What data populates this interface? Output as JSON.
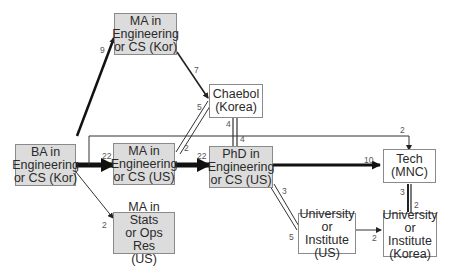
{
  "nodes": {
    "ba_kor": {
      "label": "BA in\nEngineering\nor CS (Kor)",
      "fill": "grey"
    },
    "ma_kor": {
      "label": "MA in\nEngineering\nor CS (Kor)",
      "fill": "grey"
    },
    "ma_us": {
      "label": "MA in\nEngineering\nor CS (US)",
      "fill": "grey"
    },
    "ma_stats": {
      "label": "MA in Stats\nor Ops Res\n(US)",
      "fill": "grey"
    },
    "phd_us": {
      "label": "PhD in\nEngineering\nor CS (US)",
      "fill": "grey"
    },
    "chaebol": {
      "label": "Chaebol\n(Korea)",
      "fill": "white"
    },
    "tech": {
      "label": "Tech\n(MNC)",
      "fill": "white"
    },
    "univ_us": {
      "label": "University\nor Institute\n(US)",
      "fill": "white"
    },
    "univ_kor": {
      "label": "University\nor Institute\n(Korea)",
      "fill": "white"
    }
  },
  "edges": [
    {
      "from": "ba_kor",
      "to": "ma_kor",
      "value": "9"
    },
    {
      "from": "ma_kor",
      "to": "chaebol",
      "value": "7"
    },
    {
      "from": "ma_us",
      "to": "chaebol",
      "value": "5"
    },
    {
      "from": "chaebol",
      "to": "ma_us",
      "value": "2"
    },
    {
      "from": "ba_kor",
      "to": "ma_us",
      "value": "22"
    },
    {
      "from": "ma_us",
      "to": "phd_us",
      "value": "22"
    },
    {
      "from": "ba_kor",
      "to": "ma_stats",
      "value": "2"
    },
    {
      "from": "chaebol",
      "to": "phd_us",
      "value": "4"
    },
    {
      "from": "phd_us",
      "to": "chaebol",
      "value": "4"
    },
    {
      "from": "ba_kor",
      "to": "tech",
      "value": "2"
    },
    {
      "from": "phd_us",
      "to": "tech",
      "value": "10"
    },
    {
      "from": "phd_us",
      "to": "univ_us",
      "value": "3"
    },
    {
      "from": "univ_us",
      "to": "phd_us",
      "value": "5"
    },
    {
      "from": "univ_us",
      "to": "univ_kor",
      "value": "2"
    },
    {
      "from": "tech",
      "to": "univ_kor",
      "value": "3"
    },
    {
      "from": "univ_kor",
      "to": "tech",
      "value": "2"
    }
  ],
  "labels": {
    "e_9": "9",
    "e_7": "7",
    "e_5a": "5",
    "e_2a": "2",
    "e_22a": "22",
    "e_22b": "22",
    "e_2b": "2",
    "e_4a": "4",
    "e_4b": "4",
    "e_2c": "2",
    "e_10": "10",
    "e_3a": "3",
    "e_5b": "5",
    "e_2d": "2",
    "e_3b": "3",
    "e_2e": "2"
  }
}
